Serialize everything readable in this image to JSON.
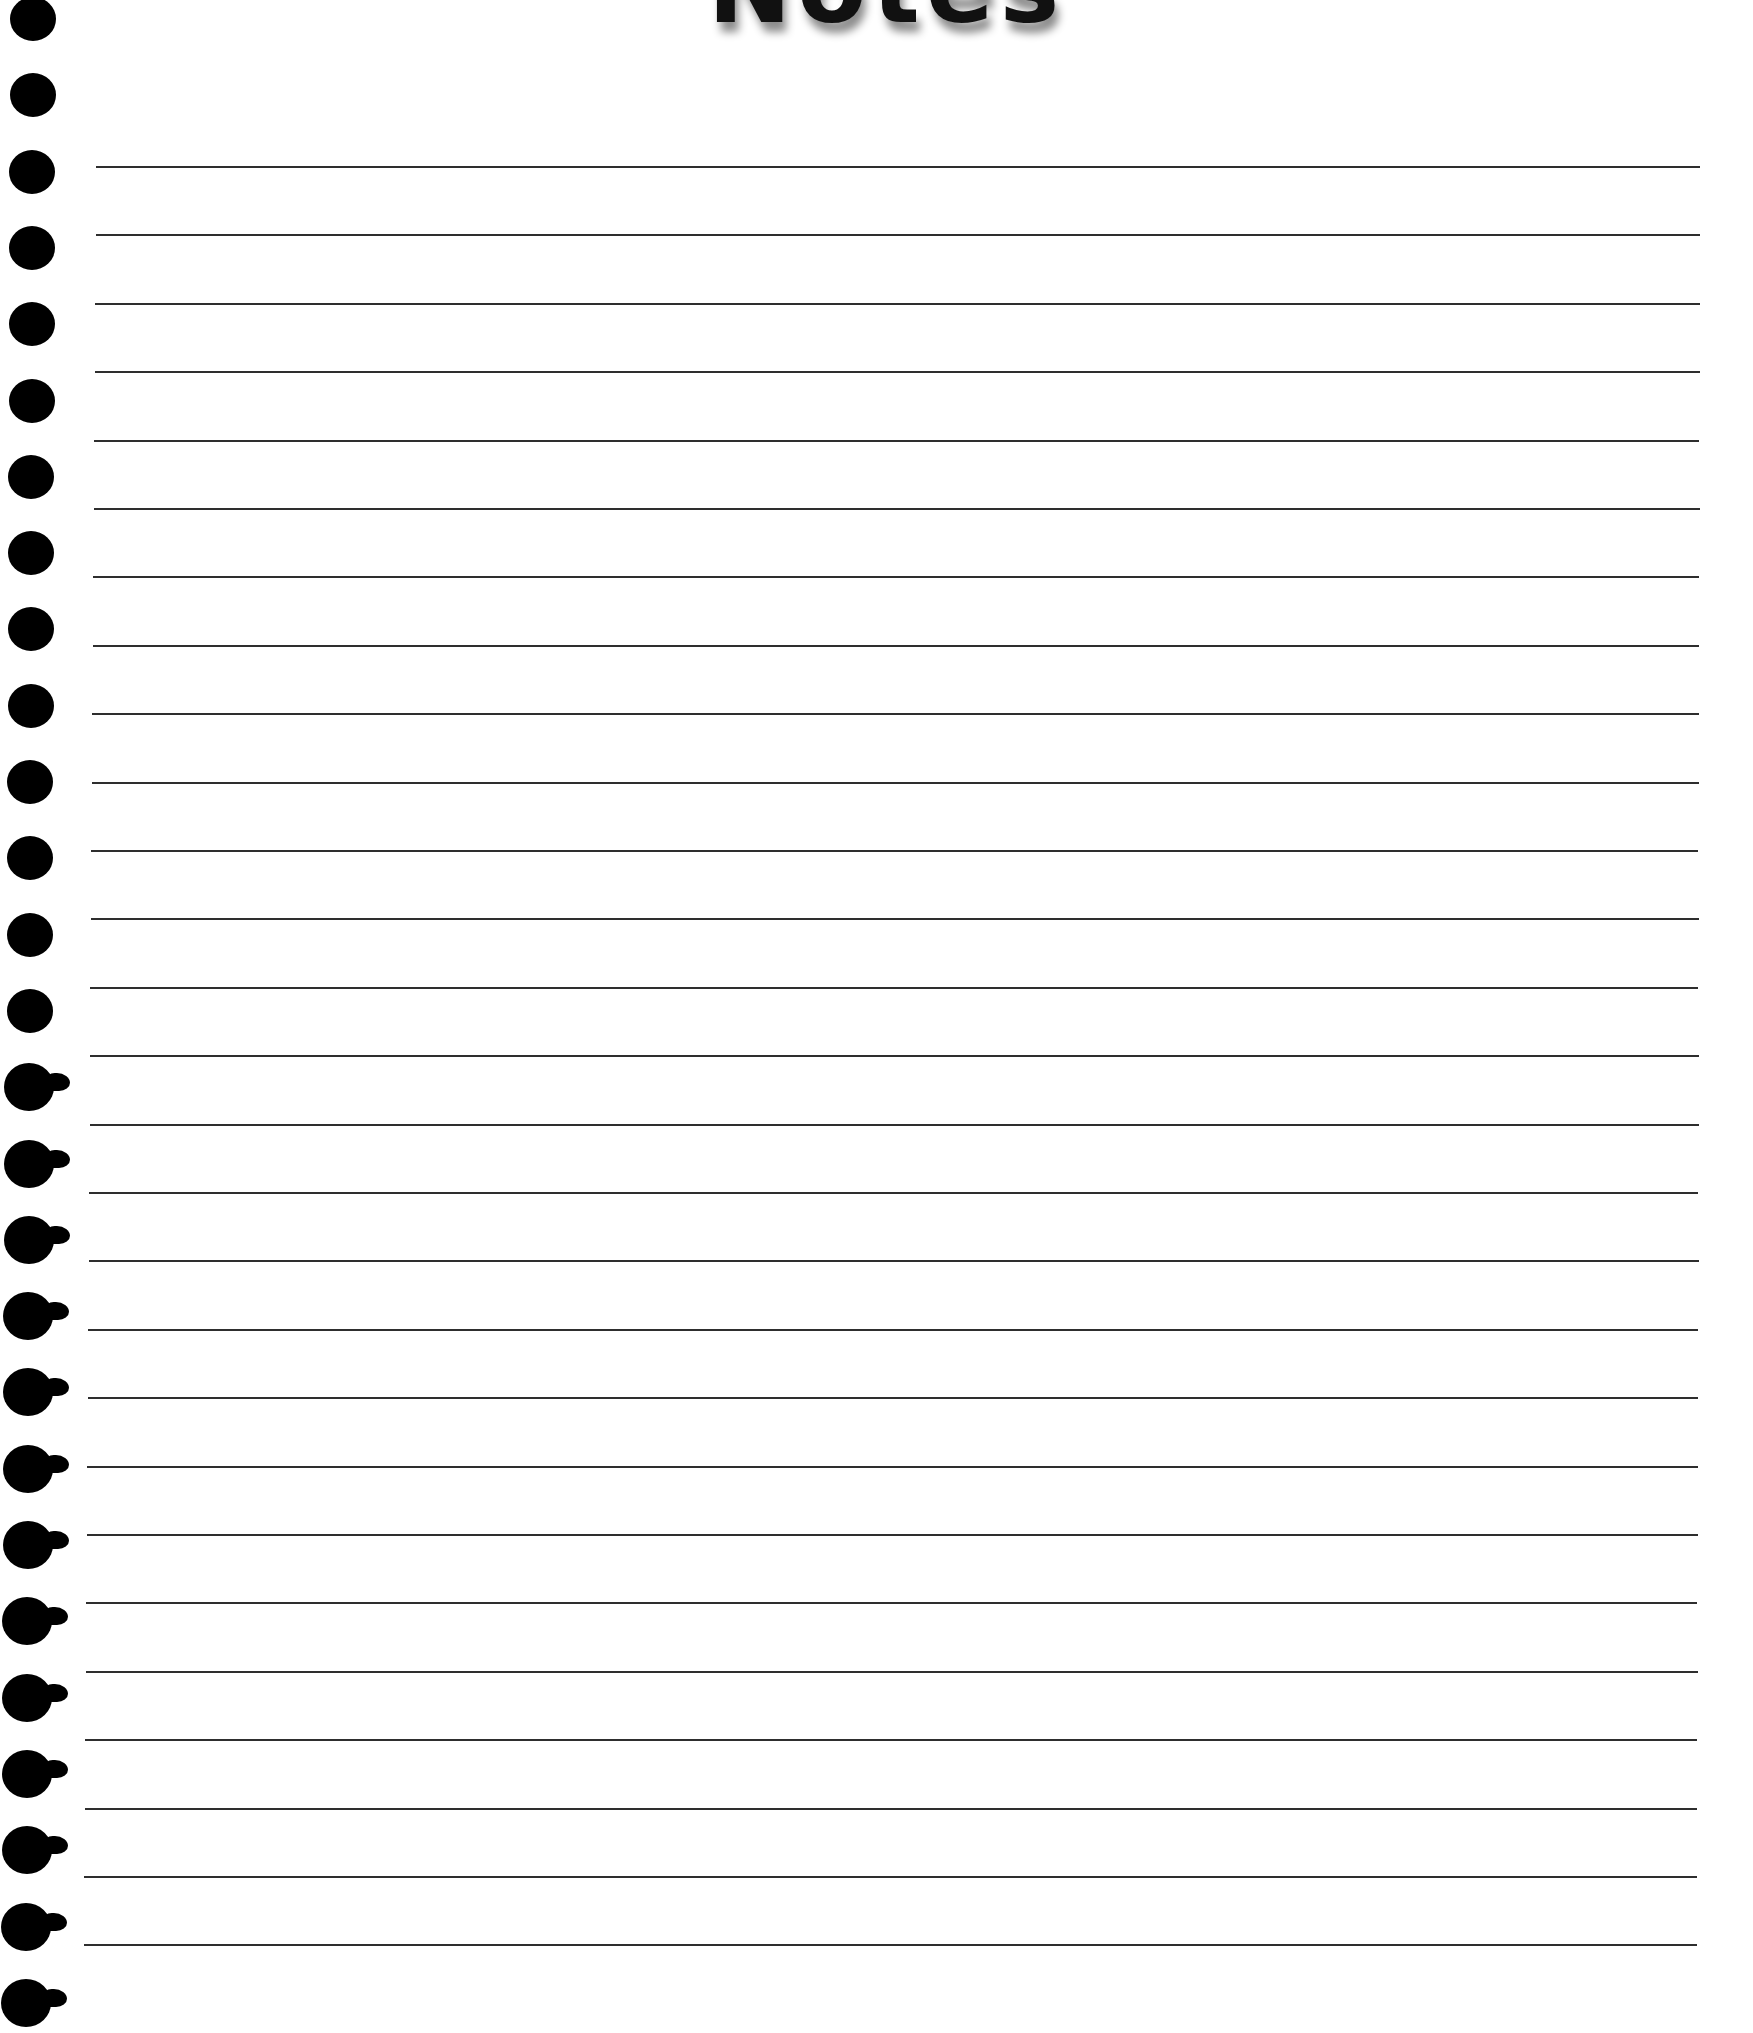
{
  "page": {
    "title": "Notes",
    "background_color": "#ffffff",
    "line_color": "#2e2e2e",
    "hole_color": "#000000"
  },
  "ruled_lines": {
    "count": 27,
    "first_y": 166,
    "spacing": 68.4,
    "start_x_top": 96,
    "start_x_bottom": 84,
    "end_x_top": 1700,
    "end_x_bottom": 1697
  },
  "punch_holes": {
    "count": 27,
    "first_center_y": 20,
    "spacing": 76.3,
    "diameter": 46,
    "center_x_top": 33,
    "center_x_bottom": 26,
    "torn_from_index": 14
  }
}
